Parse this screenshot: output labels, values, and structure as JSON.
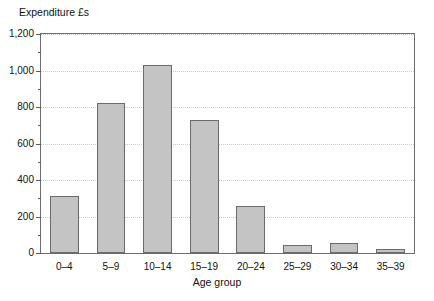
{
  "chart_data": {
    "type": "bar",
    "title": "",
    "xlabel": "Age group",
    "ylabel": "Expenditure £s",
    "categories": [
      "0–4",
      "5–9",
      "10–14",
      "15–19",
      "20–24",
      "25–29",
      "30–34",
      "35–39"
    ],
    "values": [
      310,
      820,
      1030,
      730,
      260,
      45,
      55,
      20
    ],
    "ylim": [
      0,
      1200
    ],
    "y_major_ticks": [
      0,
      200,
      400,
      600,
      800,
      1000,
      1200
    ],
    "y_tick_labels": [
      "0",
      "200",
      "400",
      "600",
      "800",
      "1,000",
      "1,200"
    ],
    "y_minor_ticks": [
      100,
      300,
      500,
      700,
      900,
      1100
    ],
    "grid": "horizontal-dotted",
    "legend": "none",
    "bar_fill": "#c4c4c4",
    "bar_border": "#6b6b6b",
    "axis_color": "#6d6d6d",
    "grid_color": "#c9c9c9"
  },
  "axes": {
    "y_title": "Expenditure £s",
    "x_title": "Age group"
  }
}
